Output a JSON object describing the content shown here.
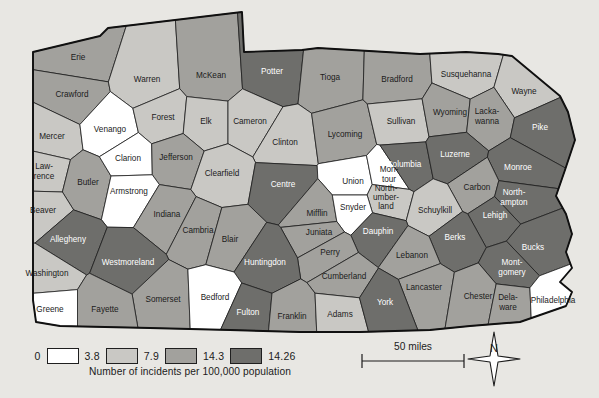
{
  "figure": {
    "background_color": "#e8e7e3",
    "map_outline_color": "#101010"
  },
  "legend": {
    "title": "Number of incidents per 100,000 population",
    "breaks": [
      "0",
      "3.8",
      "7.9",
      "14.3",
      "14.26"
    ],
    "swatch_colors": [
      "#ffffff",
      "#c9c8c4",
      "#a2a19d",
      "#6e6e6b"
    ],
    "swatch_names": [
      "legend-swatch-white",
      "legend-swatch-light",
      "legend-swatch-medium",
      "legend-swatch-dark"
    ]
  },
  "scale": {
    "label": "50 miles"
  },
  "compass": {
    "letter": "N"
  },
  "palette": {
    "c0": "#ffffff",
    "c1": "#c9c8c4",
    "c2": "#a2a19d",
    "c3": "#6e6e6b"
  },
  "chart_data": {
    "type": "choropleth-map",
    "title": "Number of incidents per 100,000 population",
    "region": "Pennsylvania",
    "unit": "incidents per 100,000 population",
    "class_breaks": [
      0,
      3.8,
      7.9,
      14.3,
      14.26
    ],
    "class_colors": [
      "#ffffff",
      "#c9c8c4",
      "#a2a19d",
      "#6e6e6b"
    ],
    "counties": [
      {
        "name": "Erie",
        "label": "Erie",
        "class": 2,
        "x": 78,
        "y": 58
      },
      {
        "name": "Crawford",
        "label": "Crawford",
        "class": 2,
        "x": 72,
        "y": 95
      },
      {
        "name": "Warren",
        "label": "Warren",
        "class": 1,
        "x": 147,
        "y": 80
      },
      {
        "name": "McKean",
        "label": "McKean",
        "class": 2,
        "x": 211,
        "y": 76
      },
      {
        "name": "Potter",
        "label": "Potter",
        "class": 3,
        "x": 272,
        "y": 72
      },
      {
        "name": "Tioga",
        "label": "Tioga",
        "class": 2,
        "x": 330,
        "y": 78
      },
      {
        "name": "Bradford",
        "label": "Bradford",
        "class": 2,
        "x": 397,
        "y": 80
      },
      {
        "name": "Susquehanna",
        "label": "Susquehanna",
        "class": 1,
        "x": 466,
        "y": 75
      },
      {
        "name": "Wayne",
        "label": "Wayne",
        "class": 1,
        "x": 524,
        "y": 92
      },
      {
        "name": "Mercer",
        "label": "Mercer",
        "class": 1,
        "x": 52,
        "y": 137
      },
      {
        "name": "Venango",
        "label": "Venango",
        "class": 0,
        "x": 110,
        "y": 130
      },
      {
        "name": "Forest",
        "label": "Forest",
        "class": 1,
        "x": 163,
        "y": 118
      },
      {
        "name": "Elk",
        "label": "Elk",
        "class": 1,
        "x": 206,
        "y": 122
      },
      {
        "name": "Cameron",
        "label": "Cameron",
        "class": 1,
        "x": 250,
        "y": 122
      },
      {
        "name": "Clinton",
        "label": "Clinton",
        "class": 1,
        "x": 285,
        "y": 143
      },
      {
        "name": "Lycoming",
        "label": "Lycoming",
        "class": 2,
        "x": 345,
        "y": 135
      },
      {
        "name": "Sullivan",
        "label": "Sullivan",
        "class": 1,
        "x": 401,
        "y": 122
      },
      {
        "name": "Wyoming",
        "label": "Wyoming",
        "class": 2,
        "x": 450,
        "y": 113
      },
      {
        "name": "Lackawanna",
        "label": "Lacka-\nwanna",
        "class": 2,
        "x": 487,
        "y": 117
      },
      {
        "name": "Pike",
        "label": "Pike",
        "class": 3,
        "x": 540,
        "y": 128
      },
      {
        "name": "Lawrence",
        "label": "Law-\nrence",
        "class": 1,
        "x": 44,
        "y": 172
      },
      {
        "name": "Butler",
        "label": "Butler",
        "class": 2,
        "x": 88,
        "y": 183
      },
      {
        "name": "Clarion",
        "label": "Clarion",
        "class": 0,
        "x": 128,
        "y": 159
      },
      {
        "name": "Jefferson",
        "label": "Jefferson",
        "class": 2,
        "x": 176,
        "y": 158
      },
      {
        "name": "Clearfield",
        "label": "Clearfield",
        "class": 1,
        "x": 222,
        "y": 174
      },
      {
        "name": "Centre",
        "label": "Centre",
        "class": 3,
        "x": 283,
        "y": 185
      },
      {
        "name": "Union",
        "label": "Union",
        "class": 0,
        "x": 353,
        "y": 182
      },
      {
        "name": "Montour",
        "label": "Mon-\ntour",
        "class": 0,
        "x": 389,
        "y": 175
      },
      {
        "name": "Columbia",
        "label": "Columbia",
        "class": 3,
        "x": 404,
        "y": 165
      },
      {
        "name": "Luzerne",
        "label": "Luzerne",
        "class": 3,
        "x": 455,
        "y": 155
      },
      {
        "name": "Monroe",
        "label": "Monroe",
        "class": 3,
        "x": 518,
        "y": 168
      },
      {
        "name": "Northumberland",
        "label": "North-\number-\nland",
        "class": 1,
        "x": 386,
        "y": 198
      },
      {
        "name": "Carbon",
        "label": "Carbon",
        "class": 2,
        "x": 477,
        "y": 188
      },
      {
        "name": "Northampton",
        "label": "North-\nampton",
        "class": 3,
        "x": 514,
        "y": 198
      },
      {
        "name": "Armstrong",
        "label": "Armstrong",
        "class": 0,
        "x": 129,
        "y": 192
      },
      {
        "name": "Indiana",
        "label": "Indiana",
        "class": 2,
        "x": 167,
        "y": 215
      },
      {
        "name": "Beaver",
        "label": "Beaver",
        "class": 1,
        "x": 43,
        "y": 211
      },
      {
        "name": "Cambria",
        "label": "Cambria",
        "class": 2,
        "x": 198,
        "y": 231
      },
      {
        "name": "Blair",
        "label": "Blair",
        "class": 2,
        "x": 230,
        "y": 240
      },
      {
        "name": "Mifflin",
        "label": "Mifflin",
        "class": 2,
        "x": 317,
        "y": 214
      },
      {
        "name": "Snyder",
        "label": "Snyder",
        "class": 0,
        "x": 353,
        "y": 208
      },
      {
        "name": "Schuylkill",
        "label": "Schuylkill",
        "class": 1,
        "x": 435,
        "y": 211
      },
      {
        "name": "Lehigh",
        "label": "Lehigh",
        "class": 3,
        "x": 495,
        "y": 216
      },
      {
        "name": "Juniata",
        "label": "Juniata",
        "class": 2,
        "x": 319,
        "y": 233
      },
      {
        "name": "Dauphin",
        "label": "Dauphin",
        "class": 3,
        "x": 378,
        "y": 232
      },
      {
        "name": "Berks",
        "label": "Berks",
        "class": 3,
        "x": 455,
        "y": 238
      },
      {
        "name": "Bucks",
        "label": "Bucks",
        "class": 3,
        "x": 533,
        "y": 248
      },
      {
        "name": "Allegheny",
        "label": "Allegheny",
        "class": 3,
        "x": 68,
        "y": 240
      },
      {
        "name": "Perry",
        "label": "Perry",
        "class": 2,
        "x": 330,
        "y": 253
      },
      {
        "name": "Lebanon",
        "label": "Lebanon",
        "class": 2,
        "x": 412,
        "y": 256
      },
      {
        "name": "Montgomery",
        "label": "Mont-\ngomery",
        "class": 3,
        "x": 512,
        "y": 268
      },
      {
        "name": "Westmoreland",
        "label": "Westmoreland",
        "class": 3,
        "x": 128,
        "y": 263
      },
      {
        "name": "Huntingdon",
        "label": "Huntingdon",
        "class": 3,
        "x": 265,
        "y": 263
      },
      {
        "name": "Cumberland",
        "label": "Cumberland",
        "class": 2,
        "x": 344,
        "y": 277
      },
      {
        "name": "Lancaster",
        "label": "Lancaster",
        "class": 2,
        "x": 424,
        "y": 288
      },
      {
        "name": "Chester",
        "label": "Chester",
        "class": 2,
        "x": 478,
        "y": 297
      },
      {
        "name": "Delaware",
        "label": "Dela-\nware",
        "class": 2,
        "x": 508,
        "y": 303
      },
      {
        "name": "Philadelphia",
        "label": "Philadelphia",
        "class": 0,
        "x": 553,
        "y": 301
      },
      {
        "name": "Washington",
        "label": "Washington",
        "class": 1,
        "x": 47,
        "y": 274
      },
      {
        "name": "Somerset",
        "label": "Somerset",
        "class": 2,
        "x": 163,
        "y": 300
      },
      {
        "name": "Bedford",
        "label": "Bedford",
        "class": 0,
        "x": 215,
        "y": 298
      },
      {
        "name": "Fulton",
        "label": "Fulton",
        "class": 3,
        "x": 248,
        "y": 313
      },
      {
        "name": "Franklin",
        "label": "Franklin",
        "class": 2,
        "x": 292,
        "y": 317
      },
      {
        "name": "Adams",
        "label": "Adams",
        "class": 1,
        "x": 340,
        "y": 315
      },
      {
        "name": "York",
        "label": "York",
        "class": 3,
        "x": 385,
        "y": 303
      },
      {
        "name": "Fayette",
        "label": "Fayette",
        "class": 2,
        "x": 105,
        "y": 310
      },
      {
        "name": "Greene",
        "label": "Greene",
        "class": 0,
        "x": 50,
        "y": 310
      }
    ]
  }
}
